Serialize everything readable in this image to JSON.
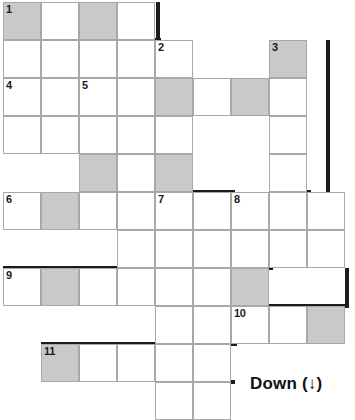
{
  "puzzle": {
    "title": "Crossword Grid",
    "cell_size": 38,
    "origin": {
      "x": 3,
      "y": 2
    },
    "colors": {
      "cell_fill": "#ffffff",
      "cell_shaded": "#c9c9c9",
      "cell_border": "#a8a8a8",
      "heavy_border": "#1c1c1c",
      "number_text": "#1a1a1a",
      "page_background": "#ffffff"
    },
    "clue_numbers": [
      1,
      2,
      3,
      4,
      5,
      6,
      7,
      8,
      9,
      10,
      11
    ],
    "cells": [
      {
        "r": 1,
        "c": 1,
        "shaded": true,
        "num": "1"
      },
      {
        "r": 1,
        "c": 2,
        "shaded": false,
        "num": ""
      },
      {
        "r": 1,
        "c": 3,
        "shaded": true,
        "num": ""
      },
      {
        "r": 1,
        "c": 4,
        "shaded": false,
        "num": ""
      },
      {
        "r": 2,
        "c": 1,
        "shaded": false,
        "num": ""
      },
      {
        "r": 2,
        "c": 2,
        "shaded": false,
        "num": ""
      },
      {
        "r": 2,
        "c": 3,
        "shaded": false,
        "num": ""
      },
      {
        "r": 2,
        "c": 4,
        "shaded": false,
        "num": ""
      },
      {
        "r": 2,
        "c": 5,
        "shaded": false,
        "num": "2"
      },
      {
        "r": 2,
        "c": 8,
        "shaded": true,
        "num": "3"
      },
      {
        "r": 3,
        "c": 1,
        "shaded": false,
        "num": "4"
      },
      {
        "r": 3,
        "c": 2,
        "shaded": false,
        "num": ""
      },
      {
        "r": 3,
        "c": 3,
        "shaded": false,
        "num": "5"
      },
      {
        "r": 3,
        "c": 4,
        "shaded": false,
        "num": ""
      },
      {
        "r": 3,
        "c": 5,
        "shaded": true,
        "num": ""
      },
      {
        "r": 3,
        "c": 6,
        "shaded": false,
        "num": ""
      },
      {
        "r": 3,
        "c": 7,
        "shaded": true,
        "num": ""
      },
      {
        "r": 3,
        "c": 8,
        "shaded": false,
        "num": ""
      },
      {
        "r": 4,
        "c": 1,
        "shaded": false,
        "num": ""
      },
      {
        "r": 4,
        "c": 2,
        "shaded": false,
        "num": ""
      },
      {
        "r": 4,
        "c": 3,
        "shaded": false,
        "num": ""
      },
      {
        "r": 4,
        "c": 4,
        "shaded": false,
        "num": ""
      },
      {
        "r": 4,
        "c": 5,
        "shaded": false,
        "num": ""
      },
      {
        "r": 4,
        "c": 8,
        "shaded": false,
        "num": ""
      },
      {
        "r": 5,
        "c": 3,
        "shaded": true,
        "num": ""
      },
      {
        "r": 5,
        "c": 4,
        "shaded": false,
        "num": ""
      },
      {
        "r": 5,
        "c": 5,
        "shaded": true,
        "num": ""
      },
      {
        "r": 5,
        "c": 8,
        "shaded": false,
        "num": ""
      },
      {
        "r": 6,
        "c": 1,
        "shaded": false,
        "num": "6"
      },
      {
        "r": 6,
        "c": 2,
        "shaded": true,
        "num": ""
      },
      {
        "r": 6,
        "c": 3,
        "shaded": false,
        "num": ""
      },
      {
        "r": 6,
        "c": 4,
        "shaded": false,
        "num": ""
      },
      {
        "r": 6,
        "c": 5,
        "shaded": false,
        "num": "7"
      },
      {
        "r": 6,
        "c": 6,
        "shaded": false,
        "num": ""
      },
      {
        "r": 6,
        "c": 7,
        "shaded": false,
        "num": "8"
      },
      {
        "r": 6,
        "c": 8,
        "shaded": false,
        "num": ""
      },
      {
        "r": 6,
        "c": 9,
        "shaded": false,
        "num": ""
      },
      {
        "r": 7,
        "c": 4,
        "shaded": false,
        "num": ""
      },
      {
        "r": 7,
        "c": 5,
        "shaded": false,
        "num": ""
      },
      {
        "r": 7,
        "c": 6,
        "shaded": false,
        "num": ""
      },
      {
        "r": 7,
        "c": 7,
        "shaded": false,
        "num": ""
      },
      {
        "r": 7,
        "c": 8,
        "shaded": false,
        "num": ""
      },
      {
        "r": 7,
        "c": 9,
        "shaded": false,
        "num": ""
      },
      {
        "r": 8,
        "c": 1,
        "shaded": false,
        "num": "9"
      },
      {
        "r": 8,
        "c": 2,
        "shaded": true,
        "num": ""
      },
      {
        "r": 8,
        "c": 3,
        "shaded": false,
        "num": ""
      },
      {
        "r": 8,
        "c": 4,
        "shaded": false,
        "num": ""
      },
      {
        "r": 8,
        "c": 5,
        "shaded": false,
        "num": ""
      },
      {
        "r": 8,
        "c": 6,
        "shaded": false,
        "num": ""
      },
      {
        "r": 8,
        "c": 7,
        "shaded": true,
        "num": ""
      },
      {
        "r": 9,
        "c": 5,
        "shaded": false,
        "num": ""
      },
      {
        "r": 9,
        "c": 6,
        "shaded": false,
        "num": ""
      },
      {
        "r": 9,
        "c": 7,
        "shaded": false,
        "num": "10"
      },
      {
        "r": 9,
        "c": 8,
        "shaded": false,
        "num": ""
      },
      {
        "r": 9,
        "c": 9,
        "shaded": true,
        "num": ""
      },
      {
        "r": 10,
        "c": 2,
        "shaded": true,
        "num": "11"
      },
      {
        "r": 10,
        "c": 3,
        "shaded": false,
        "num": ""
      },
      {
        "r": 10,
        "c": 4,
        "shaded": false,
        "num": ""
      },
      {
        "r": 10,
        "c": 5,
        "shaded": false,
        "num": ""
      },
      {
        "r": 10,
        "c": 6,
        "shaded": false,
        "num": ""
      },
      {
        "r": 11,
        "c": 5,
        "shaded": false,
        "num": ""
      },
      {
        "r": 11,
        "c": 6,
        "shaded": false,
        "num": ""
      }
    ],
    "heavy_edges": [
      {
        "x": 156,
        "y": 2,
        "w": 4,
        "h": 38
      },
      {
        "x": 41,
        "y": 38,
        "w": 4,
        "h": 40
      },
      {
        "x": 41,
        "y": 38,
        "w": 120,
        "h": 4
      },
      {
        "x": 188,
        "y": 40,
        "w": 4,
        "h": 38
      },
      {
        "x": 269,
        "y": 78,
        "w": 4,
        "h": 38
      },
      {
        "x": 192,
        "y": 112,
        "w": 81,
        "h": 4
      },
      {
        "x": 3,
        "y": 150,
        "w": 42,
        "h": 4
      },
      {
        "x": 41,
        "y": 116,
        "w": 4,
        "h": 38
      },
      {
        "x": 117,
        "y": 114,
        "w": 4,
        "h": 78
      },
      {
        "x": 79,
        "y": 114,
        "w": 42,
        "h": 4
      },
      {
        "x": 155,
        "y": 114,
        "w": 4,
        "h": 78
      },
      {
        "x": 3,
        "y": 226,
        "w": 158,
        "h": 4
      },
      {
        "x": 155,
        "y": 190,
        "w": 4,
        "h": 4
      },
      {
        "x": 326,
        "y": 40,
        "w": 4,
        "h": 192
      },
      {
        "x": 155,
        "y": 172,
        "w": 38,
        "h": 4
      },
      {
        "x": 288,
        "y": 174,
        "w": 4,
        "h": 38
      },
      {
        "x": 193,
        "y": 190,
        "w": 4,
        "h": 78
      },
      {
        "x": 193,
        "y": 190,
        "w": 42,
        "h": 4
      },
      {
        "x": 269,
        "y": 190,
        "w": 4,
        "h": 78
      },
      {
        "x": 269,
        "y": 190,
        "w": 42,
        "h": 4
      },
      {
        "x": 269,
        "y": 228,
        "w": 61,
        "h": 4
      },
      {
        "x": 3,
        "y": 266,
        "w": 158,
        "h": 4
      },
      {
        "x": 269,
        "y": 266,
        "w": 4,
        "h": 4
      },
      {
        "x": 345,
        "y": 268,
        "w": 4,
        "h": 40
      },
      {
        "x": 269,
        "y": 304,
        "w": 80,
        "h": 4
      },
      {
        "x": 41,
        "y": 342,
        "w": 196,
        "h": 4
      },
      {
        "x": 231,
        "y": 304,
        "w": 4,
        "h": 42
      },
      {
        "x": 231,
        "y": 304,
        "w": 42,
        "h": 4
      },
      {
        "x": 193,
        "y": 380,
        "w": 42,
        "h": 4
      },
      {
        "x": 193,
        "y": 342,
        "w": 4,
        "h": 40
      }
    ]
  },
  "footer": {
    "label": "Down (↓)"
  }
}
